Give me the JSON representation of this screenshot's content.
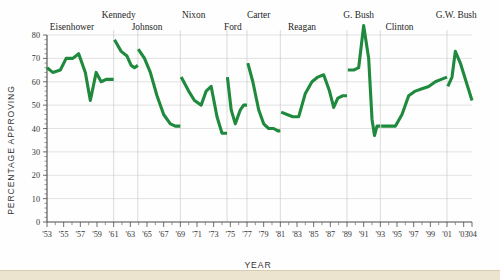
{
  "chart_data": {
    "type": "line",
    "title": "",
    "xlabel": "YEAR",
    "ylabel": "PERCENTAGE APPROVING",
    "ylim": [
      0,
      80
    ],
    "xlim": [
      1953,
      2004
    ],
    "yticks": [
      0,
      10,
      20,
      30,
      40,
      50,
      60,
      70,
      80
    ],
    "ytick_labels": [
      "0",
      "10",
      "20",
      "30",
      "40",
      "50",
      "60",
      "70",
      "80"
    ],
    "xtick_labels": [
      "'53",
      "'55",
      "'57",
      "'59",
      "'61",
      "'63",
      "'65",
      "'67",
      "'69",
      "'71",
      "'73",
      "'75",
      "'77",
      "'79",
      "'81",
      "'83",
      "'85",
      "'87",
      "'89",
      "'91",
      "'93",
      "'95",
      "'97",
      "'99",
      "'01",
      "'03",
      "'04"
    ],
    "xtick_years": [
      1953,
      1955,
      1957,
      1959,
      1961,
      1963,
      1965,
      1967,
      1969,
      1971,
      1973,
      1975,
      1977,
      1979,
      1981,
      1983,
      1985,
      1987,
      1989,
      1991,
      1993,
      1995,
      1997,
      1999,
      2001,
      2003,
      2004
    ],
    "grid": "horizontal-and-president-separators",
    "legend": "none",
    "line_color": "#1f8a3d",
    "presidents": [
      {
        "name": "Eisenhower",
        "label_x": 1956.0,
        "label_row": 1,
        "start": 1953.0,
        "end": 1961.0,
        "points": [
          [
            1953.0,
            66
          ],
          [
            1953.7,
            64
          ],
          [
            1954.6,
            65
          ],
          [
            1955.3,
            70
          ],
          [
            1956.1,
            70
          ],
          [
            1956.8,
            72
          ],
          [
            1957.6,
            64
          ],
          [
            1958.2,
            52
          ],
          [
            1958.9,
            64
          ],
          [
            1959.5,
            60
          ],
          [
            1960.1,
            61
          ],
          [
            1961.0,
            61
          ]
        ]
      },
      {
        "name": "Kennedy",
        "label_x": 1961.6,
        "label_row": 0,
        "start": 1961.0,
        "end": 1963.9,
        "points": [
          [
            1961.1,
            78
          ],
          [
            1961.9,
            73
          ],
          [
            1962.6,
            71
          ],
          [
            1963.1,
            67
          ],
          [
            1963.5,
            66
          ],
          [
            1963.9,
            67
          ]
        ]
      },
      {
        "name": "Johnson",
        "label_x": 1965.0,
        "label_row": 1,
        "start": 1963.9,
        "end": 1969.0,
        "points": [
          [
            1963.95,
            74
          ],
          [
            1964.7,
            70
          ],
          [
            1965.4,
            64
          ],
          [
            1966.2,
            54
          ],
          [
            1967.0,
            46
          ],
          [
            1967.8,
            42
          ],
          [
            1968.4,
            41
          ],
          [
            1969.0,
            41
          ]
        ]
      },
      {
        "name": "Nixon",
        "label_x": 1970.6,
        "label_row": 0,
        "start": 1969.0,
        "end": 1974.6,
        "points": [
          [
            1969.1,
            62
          ],
          [
            1970.0,
            56
          ],
          [
            1970.7,
            52
          ],
          [
            1971.5,
            50
          ],
          [
            1972.1,
            56
          ],
          [
            1972.7,
            58
          ],
          [
            1973.4,
            45
          ],
          [
            1974.0,
            38
          ],
          [
            1974.6,
            38
          ]
        ]
      },
      {
        "name": "Ford",
        "label_x": 1975.3,
        "label_row": 1,
        "start": 1974.6,
        "end": 1977.0,
        "points": [
          [
            1974.65,
            62
          ],
          [
            1975.1,
            48
          ],
          [
            1975.6,
            42
          ],
          [
            1976.2,
            48
          ],
          [
            1976.6,
            50
          ],
          [
            1977.0,
            50
          ]
        ]
      },
      {
        "name": "Carter",
        "label_x": 1978.4,
        "label_row": 0,
        "start": 1977.0,
        "end": 1981.0,
        "points": [
          [
            1977.1,
            68
          ],
          [
            1977.7,
            60
          ],
          [
            1978.4,
            48
          ],
          [
            1979.0,
            42
          ],
          [
            1979.6,
            40
          ],
          [
            1980.2,
            40
          ],
          [
            1980.7,
            39
          ],
          [
            1981.0,
            39
          ]
        ]
      },
      {
        "name": "Reagan",
        "label_x": 1983.6,
        "label_row": 1,
        "start": 1981.0,
        "end": 1989.0,
        "points": [
          [
            1981.1,
            47
          ],
          [
            1981.8,
            46
          ],
          [
            1982.5,
            45
          ],
          [
            1983.2,
            45
          ],
          [
            1984.0,
            55
          ],
          [
            1984.8,
            60
          ],
          [
            1985.5,
            62
          ],
          [
            1986.2,
            63
          ],
          [
            1986.9,
            56
          ],
          [
            1987.4,
            49
          ],
          [
            1987.9,
            53
          ],
          [
            1988.5,
            54
          ],
          [
            1989.0,
            54
          ]
        ]
      },
      {
        "name": "G. Bush",
        "label_x": 1990.4,
        "label_row": 0,
        "start": 1989.0,
        "end": 1993.0,
        "points": [
          [
            1989.1,
            65
          ],
          [
            1989.8,
            65
          ],
          [
            1990.4,
            66
          ],
          [
            1991.0,
            84
          ],
          [
            1991.6,
            70
          ],
          [
            1992.0,
            44
          ],
          [
            1992.3,
            37
          ],
          [
            1992.6,
            41
          ],
          [
            1993.0,
            41
          ]
        ]
      },
      {
        "name": "Clinton",
        "label_x": 1995.3,
        "label_row": 1,
        "start": 1993.0,
        "end": 2001.0,
        "points": [
          [
            1993.1,
            41
          ],
          [
            1994.0,
            41
          ],
          [
            1994.8,
            41
          ],
          [
            1995.6,
            46
          ],
          [
            1996.4,
            54
          ],
          [
            1997.2,
            56
          ],
          [
            1998.0,
            57
          ],
          [
            1998.8,
            58
          ],
          [
            1999.6,
            60
          ],
          [
            2000.3,
            61
          ],
          [
            2001.0,
            62
          ]
        ]
      },
      {
        "name": "G.W. Bush",
        "label_x": 2002.1,
        "label_row": 0,
        "start": 2001.0,
        "end": 2004.0,
        "points": [
          [
            2001.1,
            58
          ],
          [
            2001.6,
            62
          ],
          [
            2002.0,
            73
          ],
          [
            2002.6,
            68
          ],
          [
            2003.3,
            60
          ],
          [
            2004.0,
            52
          ]
        ]
      }
    ],
    "separator_years": [
      1961.0,
      1963.9,
      1969.0,
      1974.6,
      1977.0,
      1981.0,
      1989.0,
      1993.0,
      2001.0
    ]
  }
}
